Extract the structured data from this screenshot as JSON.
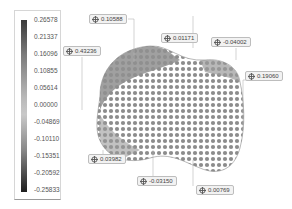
{
  "colorbar": {
    "labels": [
      "0.26578",
      "0.21337",
      "0.16096",
      "0.10855",
      "0.05614",
      "0.00000",
      "-0.04869",
      "-0.10110",
      "-0.15351",
      "-0.20592",
      "-0.25833"
    ],
    "max": 0.26578,
    "min": -0.25833
  },
  "annotations": [
    {
      "id": "a1",
      "value": "0.10588",
      "icon": "crosshair-icon"
    },
    {
      "id": "a2",
      "value": "0.43236",
      "icon": "crosshair-icon"
    },
    {
      "id": "a3",
      "value": "0.01171",
      "icon": "crosshair-icon"
    },
    {
      "id": "a4",
      "value": "-0.04002",
      "icon": "crosshair-icon"
    },
    {
      "id": "a5",
      "value": "0.19060",
      "icon": "crosshair-icon"
    },
    {
      "id": "a6",
      "value": "0.03982",
      "icon": "crosshair-icon"
    },
    {
      "id": "a7",
      "value": "-0.03150",
      "icon": "crosshair-icon"
    },
    {
      "id": "a8",
      "value": "0.00769",
      "icon": "crosshair-icon"
    }
  ],
  "colors": {
    "surface": "#8c8c8c",
    "background": "#ffffff",
    "panel_border": "#d6d6d6"
  }
}
